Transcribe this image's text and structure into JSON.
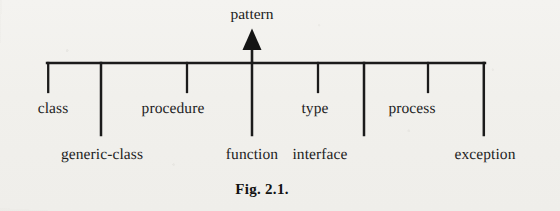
{
  "figure": {
    "caption": "Fig. 2.1.",
    "caption_x": 262,
    "root": {
      "label": "pattern",
      "x": 252,
      "arrow_tip_y": 30,
      "arrow_base_y": 63
    },
    "trunk": {
      "x_start": 47,
      "x_end": 485,
      "y": 63,
      "stroke": "#1b1b1b",
      "stroke_width": 2.4
    },
    "rows": {
      "top_stem_bottom_y": 92,
      "bottom_stem_bottom_y": 135
    },
    "nodes": [
      {
        "label": "class",
        "x": 47,
        "row": "top",
        "stem_bottom_y": 92
      },
      {
        "label": "generic-class",
        "x": 101,
        "row": "bottom",
        "stem_bottom_y": 135
      },
      {
        "label": "procedure",
        "x": 187,
        "row": "top",
        "stem_bottom_y": 92
      },
      {
        "label": "function",
        "x": 252,
        "row": "bottom",
        "stem_bottom_y": 135
      },
      {
        "label": "type",
        "x": 318,
        "row": "top",
        "stem_bottom_y": 92
      },
      {
        "label": "interface",
        "x": 364,
        "row": "bottom",
        "stem_bottom_y": 135
      },
      {
        "label": "process",
        "x": 428,
        "row": "top",
        "stem_bottom_y": 92
      },
      {
        "label": "exception",
        "x": 485,
        "row": "bottom",
        "stem_bottom_y": 135
      }
    ],
    "label_offsets": {
      "class": 53,
      "generic-class": 102,
      "procedure": 173,
      "function": 252,
      "type": 315,
      "interface": 320,
      "process": 412,
      "exception": 485
    },
    "colors": {
      "ink": "#1b1b1b",
      "text": "#1d1d1d",
      "page": "#f2f1ee"
    }
  }
}
